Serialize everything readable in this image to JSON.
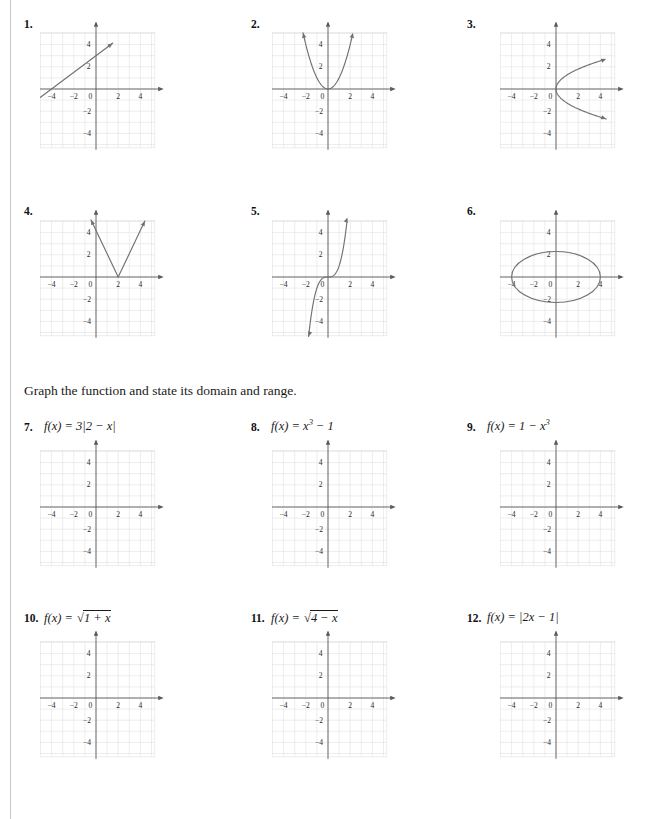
{
  "page": {
    "width": 654,
    "height": 819,
    "background": "#ffffff",
    "left_rule_color": "#c9c9c9",
    "axis_color": "#5a5a5a",
    "grid_color": "#dcdcdc",
    "curve_color": "#6e6e6e",
    "text_color": "#1a1a1a"
  },
  "instruction": {
    "text": "Graph the function and state its domain and range."
  },
  "axis_labels": {
    "x": "x",
    "y": "y",
    "origin": "0",
    "x_ticks": [
      "−4",
      "−2",
      "2",
      "4"
    ],
    "y_ticks": [
      "4",
      "2",
      "−2",
      "−4"
    ]
  },
  "problems": [
    {
      "number": "1.",
      "formula_html": "",
      "graph": "line",
      "graph_description": "straight line through (0,3) with slope 3/4",
      "has_formula": false
    },
    {
      "number": "2.",
      "formula_html": "",
      "graph": "parabola-up",
      "graph_description": "upward parabola with vertex at origin",
      "has_formula": false
    },
    {
      "number": "3.",
      "formula_html": "",
      "graph": "parabola-right",
      "graph_description": "sideways parabola opening right with vertex at origin",
      "has_formula": false
    },
    {
      "number": "4.",
      "formula_html": "",
      "graph": "absolute-v",
      "graph_description": "V shaped absolute value graph with vertex at (2,0)",
      "has_formula": false
    },
    {
      "number": "5.",
      "formula_html": "",
      "graph": "cubic",
      "graph_description": "cubic curve through origin",
      "has_formula": false
    },
    {
      "number": "6.",
      "formula_html": "",
      "graph": "ellipse",
      "graph_description": "ellipse centered at origin with x-intercepts at ±4 and y-intercepts near ±2.3",
      "has_formula": false
    },
    {
      "number": "7.",
      "formula_html": "<i>f</i>(<i>x</i>) = 3|2 − <i>x</i>|",
      "graph": "empty",
      "graph_description": "empty coordinate grid",
      "has_formula": true
    },
    {
      "number": "8.",
      "formula_html": "<i>f</i>(<i>x</i>) = <i>x</i><sup>3</sup> − 1",
      "graph": "empty",
      "graph_description": "empty coordinate grid",
      "has_formula": true
    },
    {
      "number": "9.",
      "formula_html": "<i>f</i>(<i>x</i>) = 1 − <i>x</i><sup>3</sup>",
      "graph": "empty",
      "graph_description": "empty coordinate grid",
      "has_formula": true
    },
    {
      "number": "10.",
      "formula_html": "<i>f</i>(<i>x</i>) = <span class=\"sqrt-wrap\">&#8730;<span class=\"rad-bar\">1 + <i>x</i></span></span>",
      "graph": "empty",
      "graph_description": "empty coordinate grid",
      "has_formula": true
    },
    {
      "number": "11.",
      "formula_html": "<i>f</i>(<i>x</i>) = <span class=\"sqrt-wrap\">&#8730;<span class=\"rad-bar\">4 − <i>x</i></span></span>",
      "graph": "empty",
      "graph_description": "empty coordinate grid",
      "has_formula": true
    },
    {
      "number": "12.",
      "formula_html": "<i>f</i>(<i>x</i>) = |2<i>x</i> − 1|",
      "graph": "empty",
      "graph_description": "empty coordinate grid",
      "has_formula": true
    }
  ]
}
